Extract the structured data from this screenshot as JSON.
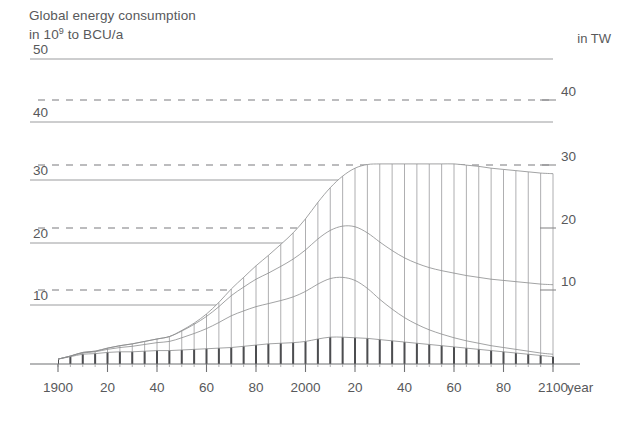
{
  "chart_data": {
    "type": "area",
    "title": "Global energy consumption",
    "subtitle": "in 10⁹ to BCU/a",
    "title_line1": "Global energy consumption",
    "title_line2_pre": "in 10",
    "title_line2_sup": "9",
    "title_line2_post": " to BCU/a",
    "unit_right": "in TW",
    "xlabel": "year",
    "ylabel": "",
    "ylabel_right": "in TW",
    "grid": true,
    "legend_position": "none",
    "xlim": [
      1900,
      2100
    ],
    "ylim_left": [
      0,
      55
    ],
    "ylim_right": [
      0,
      44.4
    ],
    "left_axis_name": "BCU/a",
    "right_axis_name": "TW",
    "left_ticks": [
      10,
      20,
      30,
      40,
      50
    ],
    "left_tick_labels": [
      "10",
      "20",
      "30",
      "40",
      "50"
    ],
    "right_ticks": [
      10,
      20,
      30,
      40
    ],
    "right_tick_labels": [
      "10",
      "20",
      "30",
      "40"
    ],
    "x_ticks": [
      1900,
      1920,
      1940,
      1960,
      1980,
      2000,
      2020,
      2040,
      2060,
      2080,
      2100
    ],
    "x_tick_labels": [
      "1900",
      "20",
      "40",
      "60",
      "80",
      "2000",
      "20",
      "40",
      "60",
      "80",
      "2100"
    ],
    "x_minor_step": 5,
    "bar_hatch": true,
    "hatch_step_years": 5,
    "x": [
      1900,
      1905,
      1910,
      1915,
      1920,
      1925,
      1930,
      1935,
      1940,
      1945,
      1950,
      1955,
      1960,
      1965,
      1970,
      1975,
      1980,
      1985,
      1990,
      1995,
      2000,
      2005,
      2010,
      2015,
      2020,
      2025,
      2030,
      2035,
      2040,
      2045,
      2050,
      2055,
      2060,
      2065,
      2070,
      2075,
      2080,
      2085,
      2090,
      2095,
      2100
    ],
    "series": [
      {
        "name": "coal",
        "color": "#55565a",
        "values": [
          0.8,
          1.2,
          1.6,
          1.7,
          1.9,
          2.0,
          2.0,
          2.1,
          2.2,
          2.2,
          2.3,
          2.4,
          2.5,
          2.6,
          2.7,
          2.9,
          3.1,
          3.3,
          3.4,
          3.5,
          3.7,
          4.1,
          4.4,
          4.4,
          4.3,
          4.2,
          4.0,
          3.8,
          3.6,
          3.4,
          3.2,
          3.0,
          2.8,
          2.6,
          2.4,
          2.2,
          2.0,
          1.8,
          1.6,
          1.4,
          1.2
        ]
      },
      {
        "name": "oil",
        "color": "#8d8e92",
        "values": [
          0.0,
          0.1,
          0.2,
          0.3,
          0.5,
          0.7,
          0.9,
          1.1,
          1.3,
          1.5,
          2.0,
          2.6,
          3.3,
          4.2,
          5.2,
          5.8,
          6.3,
          6.6,
          7.0,
          7.5,
          8.2,
          9.0,
          9.6,
          9.8,
          9.4,
          8.2,
          6.6,
          5.2,
          4.0,
          3.1,
          2.4,
          1.9,
          1.5,
          1.2,
          1.0,
          0.8,
          0.7,
          0.6,
          0.5,
          0.4,
          0.4
        ]
      },
      {
        "name": "gas",
        "color": "#a9aaad",
        "values": [
          0.0,
          0.0,
          0.1,
          0.1,
          0.2,
          0.3,
          0.4,
          0.5,
          0.6,
          0.8,
          1.1,
          1.5,
          2.0,
          2.6,
          3.3,
          3.9,
          4.5,
          5.0,
          5.6,
          6.2,
          6.8,
          7.4,
          7.9,
          8.4,
          8.8,
          9.1,
          9.4,
          9.6,
          9.8,
          10.0,
          10.2,
          10.4,
          10.6,
          10.7,
          10.8,
          10.9,
          11.0,
          11.1,
          11.2,
          11.3,
          11.4
        ]
      },
      {
        "name": "nuclear-and-renewables",
        "color": "#c8c9cb",
        "values": [
          0.0,
          0.0,
          0.0,
          0.0,
          0.0,
          0.0,
          0.0,
          0.0,
          0.0,
          0.0,
          0.1,
          0.2,
          0.4,
          0.7,
          1.1,
          1.6,
          2.2,
          2.9,
          3.6,
          4.3,
          5.1,
          6.0,
          7.0,
          8.2,
          9.6,
          11.2,
          12.8,
          14.2,
          15.4,
          16.3,
          17.0,
          17.5,
          17.9,
          18.1,
          18.2,
          18.2,
          18.2,
          18.2,
          18.2,
          18.2,
          18.2
        ]
      }
    ],
    "total": [
      0.8,
      1.3,
      1.9,
      2.1,
      2.6,
      3.0,
      3.3,
      3.7,
      4.1,
      4.5,
      5.5,
      6.7,
      8.2,
      10.1,
      12.3,
      14.2,
      16.1,
      17.8,
      19.6,
      21.5,
      23.8,
      26.5,
      28.9,
      30.8,
      32.1,
      32.7,
      32.8,
      32.8,
      32.8,
      32.8,
      32.8,
      32.8,
      32.8,
      32.6,
      32.4,
      32.1,
      31.9,
      31.7,
      31.5,
      31.3,
      31.2
    ],
    "annotations": []
  }
}
